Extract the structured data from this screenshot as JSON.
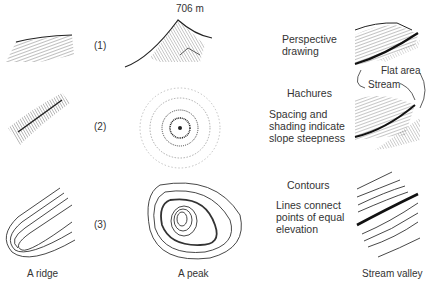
{
  "rows": [
    {
      "number": "(1)",
      "title": "Perspective drawing",
      "title_lines": [
        "Perspective",
        "drawing"
      ],
      "description_lines": []
    },
    {
      "number": "(2)",
      "title": "Hachures",
      "title_lines": [
        "Hachures"
      ],
      "description_lines": [
        "Spacing and",
        "shading indicate",
        "slope steepness"
      ]
    },
    {
      "number": "(3)",
      "title": "Contours",
      "title_lines": [
        "Contours"
      ],
      "description_lines": [
        "Lines connect",
        "points of equal",
        "elevation"
      ]
    }
  ],
  "columns": [
    {
      "caption": "A ridge"
    },
    {
      "caption": "A peak"
    },
    {
      "caption": "Stream valley"
    }
  ],
  "peak_elevation_label": "706 m",
  "annotations": {
    "flat_area": "Flat area",
    "stream": "Stream"
  },
  "contour_labels": [
    "700",
    "680",
    "660",
    "640",
    "620",
    "600",
    "580",
    "560",
    "540"
  ]
}
